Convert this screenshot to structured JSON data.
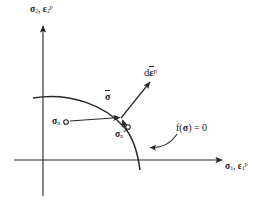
{
  "figure": {
    "type": "diagram",
    "background_color": "#ffffff",
    "stroke_color": "#262626",
    "axes": {
      "y_axis_label": "σ₂, ε₂ᵖ",
      "x_axis_label": "σ₁, ε₁ᵖ",
      "y_axis_label_parts": {
        "first": "σ",
        "first_sub": "2",
        "second": "ε",
        "second_sub": "2",
        "second_sup": "p"
      },
      "x_axis_label_parts": {
        "first": "σ",
        "first_sub": "1",
        "second": "ε",
        "second_sub": "1",
        "second_sup": "p"
      },
      "origin_px": {
        "x": 43,
        "y": 160
      },
      "x_axis_extent_px": {
        "from": 14,
        "to": 228
      },
      "y_axis_extent_px": {
        "from": 22,
        "to": 196
      },
      "arrowheads": [
        "y-axis-top",
        "x-axis-right"
      ]
    },
    "labels": {
      "sigma_bar": "σ̄",
      "d_eps_bar_p": "dε̄ᵖ",
      "sigma_n": "σₙ",
      "sigma_n_star": "σₙ*",
      "yield_function": "f(σ) = 0"
    },
    "label_parts": {
      "sigma_bar": {
        "sym": "σ",
        "overbar": true
      },
      "d_eps_bar_p": {
        "prefix": "d",
        "sym": "ε",
        "overbar": true,
        "sup": "p"
      },
      "sigma_n": {
        "sym": "σ",
        "sub": "n"
      },
      "sigma_n_star": {
        "sym": "σ",
        "sub": "n",
        "sup": "*"
      },
      "yield_function": {
        "text": "f(",
        "sym": "σ",
        "suffix": ") = 0"
      }
    },
    "points": {
      "sigma_n": {
        "x": 65,
        "y": 122,
        "marker": "open-circle"
      },
      "sigma_n_star": {
        "x": 124,
        "y": 127,
        "marker": "open-circle"
      },
      "sigma_bar": {
        "x": 122,
        "y": 117,
        "marker": "arrow-tip"
      }
    },
    "vectors": [
      {
        "name": "trial-stress-return",
        "from": {
          "x": 68,
          "y": 121
        },
        "to": {
          "x": 122,
          "y": 117
        },
        "arrow": "end"
      },
      {
        "name": "corrector-return",
        "from": {
          "x": 126,
          "y": 130
        },
        "to": {
          "x": 122,
          "y": 118
        },
        "arrow": "end"
      },
      {
        "name": "plastic-strain-increment",
        "from": {
          "x": 122,
          "y": 117
        },
        "to": {
          "x": 152,
          "y": 80
        },
        "arrow": "end"
      }
    ],
    "yield_surface": {
      "name": "yield-surface-curve",
      "path": "M 33,98 C 70,92 105,105 125,128 C 134,139 138,155 140,170",
      "crosses_y_axis_at_px": {
        "x": 43,
        "y": 97
      },
      "crosses_x_axis_at_px": {
        "x": 139,
        "y": 160
      }
    },
    "leader": {
      "name": "yield-function-leader",
      "path": "M 176,133 C 168,143 158,147 148,147",
      "arrow": "end",
      "arrow_target_px": {
        "x": 142,
        "y": 147
      }
    }
  }
}
